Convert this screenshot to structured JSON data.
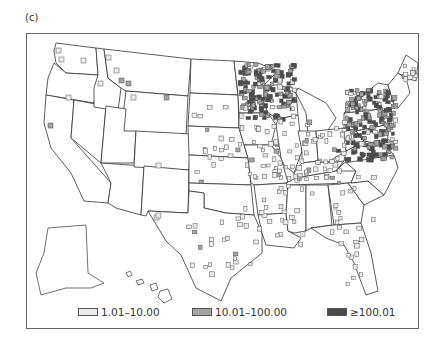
{
  "panel_label": "(c)",
  "map": {
    "region": "United States (counties, with Alaska and Hawaii insets)",
    "outline_color": "#333333",
    "background_fill": "#ffffff"
  },
  "legend": {
    "items": [
      {
        "label": "1.01–10.00",
        "color": "#ebebeb",
        "category": "low"
      },
      {
        "label": "10.01–100.00",
        "color": "#a3a3a3",
        "category": "mid"
      },
      {
        "label": "≥100.01",
        "color": "#4a4a4a",
        "category": "high"
      }
    ]
  }
}
